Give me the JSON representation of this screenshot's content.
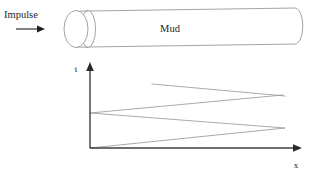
{
  "figure": {
    "caption_labels": {
      "impulse": "Impulse",
      "medium": "Mud",
      "y_axis": "t",
      "x_axis": "x"
    },
    "colors": {
      "background": "#ffffff",
      "pipe_stroke": "#8d8d8d",
      "axis_stroke": "#3c3c3c",
      "characteristic_stroke": "#9a9a9a",
      "text": "#1d1d1d",
      "impulse_arrow": "#1d1d1d"
    },
    "pipe": {
      "medium_label": "Mud",
      "left_cap_count": 2,
      "right_cap": "rounded",
      "bounds": {
        "x": 62,
        "y": 6,
        "width": 242,
        "height": 40
      }
    },
    "impulse": {
      "label": "Impulse",
      "arrow_direction": "right",
      "arrow_icon": "arrow-right-icon"
    }
  },
  "chart_data": {
    "type": "line",
    "title": "",
    "subtitle": "",
    "xlabel": "x",
    "ylabel": "t",
    "grid": false,
    "legend": "none",
    "axis_origin_px": {
      "x": 90,
      "y": 148
    },
    "xlim": [
      0,
      1
    ],
    "ylim": [
      0,
      1
    ],
    "annotations": [
      "Impulse",
      "Mud"
    ],
    "series": [
      {
        "name": "incident-and-reflected-wave-path",
        "comment": "Lower zigzag: starts at origin, reflects at far end, returns to near end, reflects again.",
        "points_px": [
          {
            "x": 90,
            "y": 148
          },
          {
            "x": 285,
            "y": 128
          },
          {
            "x": 90,
            "y": 113
          },
          {
            "x": 283,
            "y": 95
          }
        ]
      },
      {
        "name": "later-reflection-segment",
        "comment": "Upper single segment: continuation of the wave path after further reflection.",
        "points_px": [
          {
            "x": 152,
            "y": 84
          },
          {
            "x": 285,
            "y": 96
          }
        ]
      }
    ],
    "vertices": [
      {
        "label": "origin-impulse-start",
        "x_px": 90,
        "y_px": 148
      },
      {
        "label": "far-end-reflection-1",
        "x_px": 285,
        "y_px": 128
      },
      {
        "label": "near-end-reflection-1",
        "x_px": 90,
        "y_px": 113
      },
      {
        "label": "far-end-reflection-2",
        "x_px": 283,
        "y_px": 95
      },
      {
        "label": "upper-segment-start",
        "x_px": 152,
        "y_px": 84
      }
    ]
  }
}
